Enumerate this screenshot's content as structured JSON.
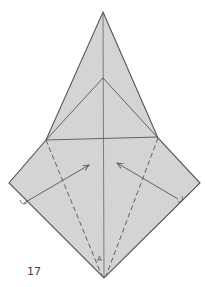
{
  "diagram": {
    "step_number": "17",
    "point_label": "A",
    "colors": {
      "paper": "#d4d4d4",
      "line": "#555555",
      "background": "#ffffff"
    },
    "points": {
      "top_apex": [
        103,
        12
      ],
      "inner_apex": [
        103,
        78
      ],
      "left_shoulder": [
        46,
        140
      ],
      "right_shoulder": [
        158,
        138
      ],
      "left_corner": [
        9,
        183
      ],
      "right_corner": [
        200,
        183
      ],
      "bottom": [
        104,
        278
      ]
    },
    "arrows": [
      {
        "name": "left-fold-arrow",
        "from": [
          24,
          203
        ],
        "to": [
          89,
          165
        ]
      },
      {
        "name": "right-fold-arrow",
        "from": [
          178,
          199
        ],
        "to": [
          117,
          163
        ]
      }
    ],
    "valley_folds": [
      {
        "name": "left-valley-fold",
        "from": [
          46,
          140
        ],
        "to": [
          102,
          276
        ]
      },
      {
        "name": "right-valley-fold",
        "from": [
          158,
          138
        ],
        "to": [
          106,
          276
        ]
      }
    ]
  }
}
